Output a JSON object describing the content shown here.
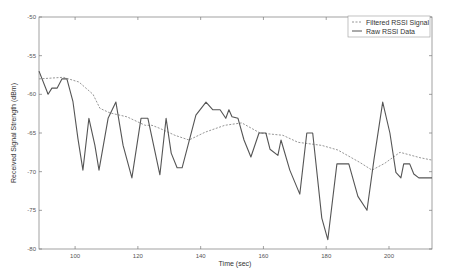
{
  "chart_data": {
    "type": "line",
    "title": "",
    "xlabel": "Time (sec)",
    "ylabel": "Received Signal Strength (dBm)",
    "xlim": [
      88.5,
      213.7
    ],
    "ylim": [
      -80,
      -50
    ],
    "xticks": [
      100,
      120,
      140,
      160,
      180,
      200
    ],
    "yticks": [
      -50,
      -55,
      -60,
      -65,
      -70,
      -75,
      -80
    ],
    "grid": false,
    "legend_position": "upper right",
    "legend": [
      "Filtered RSSI Signal",
      "Raw RSSI Data"
    ],
    "series": [
      {
        "name": "Filtered RSSI Signal",
        "style": "dashed",
        "color": "#8a8a8a",
        "x": [
          88.5,
          96.2,
          101.2,
          105.7,
          107.9,
          111.1,
          116.5,
          122.3,
          124.5,
          127.0,
          131.8,
          136.3,
          141.4,
          147.7,
          153.1,
          158.9,
          166.2,
          171.0,
          178.6,
          183.7,
          190.7,
          194.6,
          198.7,
          203.5,
          209.9,
          213.7
        ],
        "y": [
          -58.0,
          -57.8,
          -58.4,
          -60.0,
          -61.8,
          -62.4,
          -62.9,
          -64.0,
          -64.0,
          -64.4,
          -65.3,
          -65.9,
          -64.9,
          -64.0,
          -63.7,
          -65.0,
          -65.3,
          -66.2,
          -66.6,
          -67.2,
          -68.8,
          -69.8,
          -68.9,
          -67.5,
          -68.2,
          -68.5
        ]
      },
      {
        "name": "Raw RSSI Data",
        "style": "solid",
        "color": "#555555",
        "x": [
          88.5,
          91.4,
          92.6,
          94.3,
          95.8,
          97.4,
          99.3,
          100.9,
          102.5,
          104.4,
          106.3,
          107.6,
          110.5,
          113.0,
          115.3,
          118.1,
          121.0,
          123.2,
          127.0,
          129.0,
          130.6,
          132.5,
          134.1,
          138.5,
          141.7,
          143.9,
          146.2,
          148.0,
          149.0,
          150.0,
          151.9,
          153.8,
          156.0,
          158.6,
          160.8,
          162.1,
          164.6,
          165.6,
          168.4,
          171.6,
          173.8,
          175.7,
          178.6,
          180.5,
          183.4,
          187.2,
          190.1,
          193.0,
          195.2,
          198.0,
          200.3,
          202.2,
          203.8,
          204.7,
          206.6,
          207.9,
          209.5,
          213.7
        ],
        "y": [
          -57.0,
          -60.0,
          -59.2,
          -59.2,
          -58.0,
          -58.0,
          -60.9,
          -65.7,
          -69.8,
          -63.1,
          -66.6,
          -69.8,
          -63.1,
          -61.0,
          -66.6,
          -70.8,
          -63.1,
          -63.1,
          -70.4,
          -63.1,
          -67.6,
          -69.5,
          -69.5,
          -62.7,
          -61.0,
          -62.0,
          -62.0,
          -63.1,
          -62.0,
          -62.9,
          -63.1,
          -65.9,
          -68.1,
          -65.0,
          -65.0,
          -67.1,
          -67.9,
          -65.9,
          -69.8,
          -72.9,
          -65.0,
          -65.0,
          -76.0,
          -78.8,
          -69.0,
          -69.0,
          -73.2,
          -75.0,
          -68.5,
          -61.0,
          -65.0,
          -70.1,
          -70.8,
          -69.0,
          -69.0,
          -70.3,
          -70.8,
          -70.8
        ]
      }
    ]
  },
  "plot": {
    "left": 39,
    "right": 432,
    "top": 17,
    "bottom": 249,
    "axis_color": "#7a7a7a",
    "background": "#ffffff"
  }
}
